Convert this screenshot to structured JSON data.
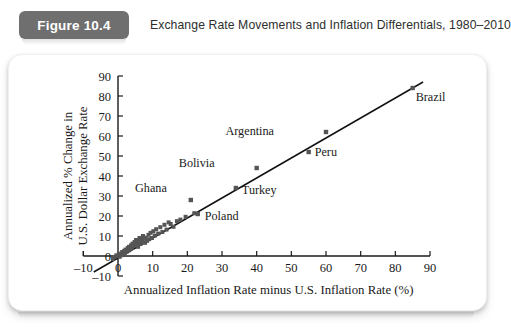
{
  "header": {
    "badge_label": "Figure 10.4",
    "title": "Exchange Rate Movements and Inflation Differentials, 1980–2010",
    "badge_color": "#6f6f6f",
    "badge_text_color": "#ffffff"
  },
  "chart_data": {
    "type": "scatter",
    "title": "Exchange Rate Movements and Inflation Differentials, 1980–2010",
    "xlabel": "Annualized Inflation Rate minus U.S. Inflation Rate (%)",
    "ylabel": "Annualized % Change in U.S. Dollar Exchange Rate",
    "ylabel_line1": "Annualized % Change in",
    "ylabel_line2": "U.S. Dollar Exchange Rate",
    "xlim": [
      -10,
      90
    ],
    "ylim": [
      -10,
      90
    ],
    "xticks": [
      -10,
      0,
      10,
      20,
      30,
      40,
      50,
      60,
      70,
      80,
      90
    ],
    "yticks": [
      -10,
      0,
      10,
      20,
      30,
      40,
      50,
      60,
      70,
      80,
      90
    ],
    "xtick_labels": [
      "–10",
      "0",
      "10",
      "20",
      "30",
      "40",
      "50",
      "60",
      "70",
      "80",
      "90"
    ],
    "ytick_labels": [
      "–10",
      "0",
      "10",
      "20",
      "30",
      "40",
      "50",
      "60",
      "70",
      "80",
      "90"
    ],
    "grid": false,
    "legend": "none",
    "marker_color": "#555555",
    "line_color": "#111111",
    "fit_line": {
      "x0": -7,
      "y0": -8,
      "x1": 88,
      "y1": 87
    },
    "labeled_points": [
      {
        "label": "Brazil",
        "x": 85,
        "y": 84,
        "label_dx": 3,
        "label_dy": 13
      },
      {
        "label": "Argentina",
        "x": 60,
        "y": 62,
        "label_dx": -52,
        "label_dy": 3
      },
      {
        "label": "Peru",
        "x": 55,
        "y": 52,
        "label_dx": 6,
        "label_dy": 4
      },
      {
        "label": "Bolivia",
        "x": 40,
        "y": 44,
        "label_dx": -42,
        "label_dy": -1
      },
      {
        "label": "Turkey",
        "x": 34,
        "y": 34,
        "label_dx": 6,
        "label_dy": 6
      },
      {
        "label": "Ghana",
        "x": 21,
        "y": 28,
        "label_dx": -24,
        "label_dy": -8
      },
      {
        "label": "Poland",
        "x": 23,
        "y": 21,
        "label_dx": 7,
        "label_dy": 6
      }
    ],
    "points": [
      {
        "x": -1.5,
        "y": -1.5
      },
      {
        "x": -1.0,
        "y": -0.5
      },
      {
        "x": -0.5,
        "y": 0.3
      },
      {
        "x": 0.0,
        "y": 0.0
      },
      {
        "x": 0.2,
        "y": 0.8
      },
      {
        "x": 0.5,
        "y": -0.4
      },
      {
        "x": 0.8,
        "y": 1.2
      },
      {
        "x": 1.0,
        "y": 0.4
      },
      {
        "x": 1.2,
        "y": 2.0
      },
      {
        "x": 1.5,
        "y": 1.0
      },
      {
        "x": 1.8,
        "y": 2.6
      },
      {
        "x": 2.0,
        "y": 1.6
      },
      {
        "x": 2.2,
        "y": 3.2
      },
      {
        "x": 2.5,
        "y": 2.2
      },
      {
        "x": 2.8,
        "y": 4.0
      },
      {
        "x": 3.0,
        "y": 2.8
      },
      {
        "x": 3.2,
        "y": 4.6
      },
      {
        "x": 3.5,
        "y": 3.4
      },
      {
        "x": 3.8,
        "y": 5.4
      },
      {
        "x": 4.0,
        "y": 4.0
      },
      {
        "x": 4.2,
        "y": 6.2
      },
      {
        "x": 4.5,
        "y": 5.0
      },
      {
        "x": 4.8,
        "y": 7.0
      },
      {
        "x": 5.0,
        "y": 5.6
      },
      {
        "x": 5.2,
        "y": 8.0
      },
      {
        "x": 5.5,
        "y": 6.4
      },
      {
        "x": 5.8,
        "y": 4.6
      },
      {
        "x": 6.0,
        "y": 7.2
      },
      {
        "x": 6.2,
        "y": 9.0
      },
      {
        "x": 6.5,
        "y": 6.0
      },
      {
        "x": 6.8,
        "y": 8.2
      },
      {
        "x": 7.0,
        "y": 7.0
      },
      {
        "x": 7.2,
        "y": 10.0
      },
      {
        "x": 7.5,
        "y": 8.6
      },
      {
        "x": 7.8,
        "y": 6.6
      },
      {
        "x": 8.0,
        "y": 9.2
      },
      {
        "x": 8.4,
        "y": 7.6
      },
      {
        "x": 8.8,
        "y": 10.6
      },
      {
        "x": 9.0,
        "y": 8.4
      },
      {
        "x": 9.4,
        "y": 11.6
      },
      {
        "x": 9.8,
        "y": 9.0
      },
      {
        "x": 10.2,
        "y": 12.4
      },
      {
        "x": 10.6,
        "y": 10.2
      },
      {
        "x": 11.0,
        "y": 13.4
      },
      {
        "x": 11.6,
        "y": 11.2
      },
      {
        "x": 12.2,
        "y": 14.4
      },
      {
        "x": 12.8,
        "y": 12.0
      },
      {
        "x": 13.4,
        "y": 15.6
      },
      {
        "x": 14.0,
        "y": 13.2
      },
      {
        "x": 14.6,
        "y": 16.8
      },
      {
        "x": 15.2,
        "y": 16.0
      },
      {
        "x": 16.0,
        "y": 14.6
      },
      {
        "x": 17.0,
        "y": 17.4
      },
      {
        "x": 18.0,
        "y": 18.2
      },
      {
        "x": 19.5,
        "y": 19.6
      },
      {
        "x": 22.0,
        "y": 21.4
      }
    ]
  }
}
